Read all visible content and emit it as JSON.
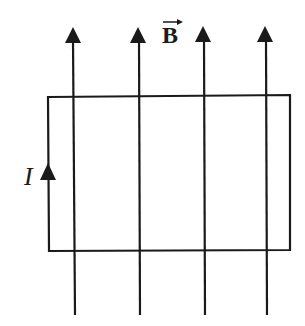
{
  "diagram": {
    "type": "physics-magnetic-field-loop",
    "field_label": "B",
    "field_label_has_vector_arrow": true,
    "current_label": "I",
    "field_direction": "up",
    "current_direction_left_side": "up",
    "field_lines_x": [
      73,
      139,
      204,
      266
    ],
    "loop": {
      "x1": 48,
      "y1": 96,
      "x2": 290,
      "y2": 250
    },
    "colors": {
      "line": "#1a1a1a",
      "background": "#ffffff"
    }
  }
}
